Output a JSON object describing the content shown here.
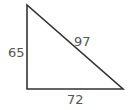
{
  "diagram": {
    "type": "right-triangle",
    "line_color": "#333333",
    "label_color": "#555555",
    "vertices": {
      "top": [
        27,
        5
      ],
      "right_angle": [
        27,
        89
      ],
      "right": [
        123,
        89
      ]
    },
    "sides": {
      "vertical_leg": "65",
      "horizontal_leg": "72",
      "hypotenuse": "97"
    }
  }
}
